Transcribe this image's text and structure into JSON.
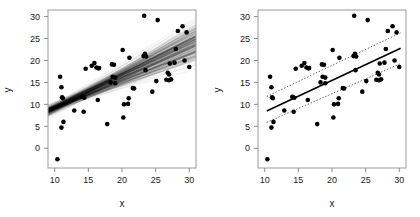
{
  "figure": {
    "background": "#ffffff",
    "point_color": "#000000",
    "line_color": "#000000",
    "ci_color": "#4d4d4d",
    "frame_color": "#9a9a9a",
    "panels": [
      {
        "id": "left",
        "name": "posterior-density-band-panel",
        "overlay": "density-band"
      },
      {
        "id": "right",
        "name": "fit-with-confidence-band-panel",
        "overlay": "fit-and-ci"
      }
    ]
  },
  "chart_data": {
    "type": "scatter",
    "title": "",
    "xlabel": "x",
    "ylabel": "y",
    "xlim": [
      9.0,
      31.0
    ],
    "ylim": [
      -4.5,
      31.5
    ],
    "xticks": [
      10,
      15,
      20,
      25,
      30
    ],
    "yticks": [
      0,
      5,
      10,
      15,
      20,
      25,
      30
    ],
    "xticklabels": [
      "10",
      "15",
      "20",
      "25",
      "30"
    ],
    "yticklabels": [
      "0",
      "5",
      "10",
      "15",
      "20",
      "25",
      "30"
    ],
    "grid": false,
    "legend": null,
    "n_points": 55,
    "x": [
      10.4,
      10.8,
      11.0,
      11.0,
      11.1,
      11.2,
      11.3,
      12.9,
      14.1,
      14.3,
      14.4,
      14.6,
      15.5,
      15.9,
      16.2,
      16.4,
      16.5,
      16.6,
      17.8,
      18.3,
      18.5,
      18.6,
      18.8,
      19.0,
      19.0,
      20.1,
      20.2,
      20.3,
      20.9,
      21.0,
      21.1,
      21.6,
      21.8,
      23.2,
      23.3,
      23.4,
      23.4,
      23.5,
      23.6,
      24.5,
      25.1,
      25.3,
      26.6,
      26.8,
      27.0,
      27.0,
      27.1,
      27.3,
      27.8,
      28.0,
      28.3,
      29.0,
      29.3,
      29.6,
      30.0
    ],
    "y": [
      -2.5,
      16.3,
      13.9,
      4.7,
      11.6,
      11.4,
      6.0,
      8.6,
      11.7,
      8.3,
      11.5,
      18.1,
      18.8,
      19.4,
      18.4,
      11.0,
      18.2,
      18.3,
      5.5,
      15.0,
      19.1,
      16.3,
      19.0,
      14.8,
      16.1,
      22.4,
      7.0,
      10.0,
      10.1,
      11.4,
      20.6,
      13.7,
      13.6,
      21.0,
      30.2,
      21.5,
      21.3,
      17.8,
      20.9,
      12.9,
      15.3,
      29.2,
      15.6,
      17.2,
      15.5,
      16.8,
      19.3,
      15.7,
      19.5,
      22.6,
      26.7,
      27.8,
      20.0,
      26.4,
      18.5
    ],
    "series": [
      {
        "name": "regression-fit",
        "type": "line",
        "style": "solid",
        "intercept": 1.0,
        "slope": 0.72,
        "x_start": 10.3,
        "x_end": 30.2,
        "y_start": 8.5,
        "y_end": 22.8
      },
      {
        "name": "confidence-upper",
        "type": "line",
        "style": "dotted",
        "x_start": 10.3,
        "x_end": 30.2,
        "y_start": 11.8,
        "y_end": 26.3
      },
      {
        "name": "confidence-lower",
        "type": "line",
        "style": "dotted",
        "x_start": 10.3,
        "x_end": 30.2,
        "y_start": 5.9,
        "y_end": 19.3
      },
      {
        "name": "posterior-line-band",
        "type": "density-band",
        "style": "overplotted-lines",
        "n_lines": 220,
        "pivot_x": 11.0,
        "pivot_y": 9.9,
        "slope_min": 0.46,
        "slope_max": 0.97,
        "intercept_jitter": 1.2
      }
    ]
  }
}
